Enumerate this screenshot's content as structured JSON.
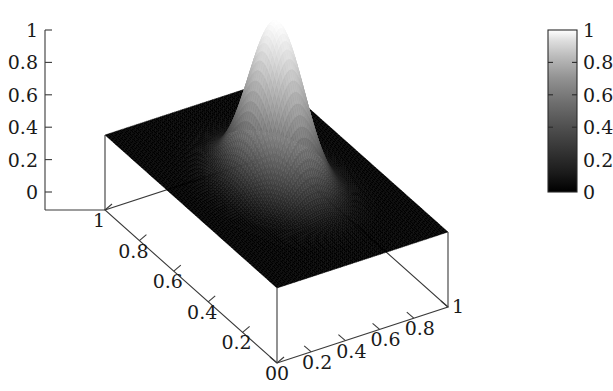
{
  "figure": {
    "type": "surface-plot-3d",
    "background_color": "#ffffff",
    "axis_color": "#3a3a3a",
    "text_color": "#1a1a1a"
  },
  "chart_data": {
    "type": "heatmap",
    "render_style": "3d-surface-mesh",
    "title": "",
    "xlabel": "",
    "ylabel": "",
    "zlabel": "",
    "grid": false,
    "xlim": [
      0,
      1
    ],
    "ylim": [
      0,
      1
    ],
    "zlim": [
      0,
      1
    ],
    "x_ticks": [
      0,
      0.2,
      0.4,
      0.6,
      0.8,
      1
    ],
    "x_tick_labels": [
      "0",
      "0.2",
      "0.4",
      "0.6",
      "0.8",
      "1"
    ],
    "y_ticks": [
      0,
      0.2,
      0.4,
      0.6,
      0.8,
      1
    ],
    "y_tick_labels": [
      "0",
      "0.2",
      "0.4",
      "0.6",
      "0.8",
      "1"
    ],
    "z_ticks": [
      0,
      0.2,
      0.4,
      0.6,
      0.8,
      1
    ],
    "z_tick_labels": [
      "0",
      "0.2",
      "0.4",
      "0.6",
      "0.8",
      "1"
    ],
    "colormap": "grayscale",
    "colormap_low": "#000000",
    "colormap_high": "#ffffff",
    "surface_function": "gaussian-peak",
    "peak": {
      "x": 0.5,
      "y": 0.5,
      "height": 1.0,
      "sigma": 0.115
    },
    "baseline_value": 0.0,
    "mesh_resolution": 86
  },
  "colorbar": {
    "orientation": "vertical",
    "min": 0,
    "max": 1,
    "ticks": [
      0,
      0.2,
      0.4,
      0.6,
      0.8,
      1
    ],
    "tick_labels": [
      "0",
      "0.2",
      "0.4",
      "0.6",
      "0.8",
      "1"
    ]
  },
  "z_axis": {
    "tick_labels": [
      "1",
      "0.8",
      "0.6",
      "0.4",
      "0.2",
      "0"
    ]
  },
  "x_axis_front_right": {
    "tick_labels": [
      "0",
      "0.2",
      "0.4",
      "0.6",
      "0.8",
      "1"
    ]
  },
  "y_axis_front_left": {
    "tick_labels": [
      "1",
      "0.8",
      "0.6",
      "0.4",
      "0.2",
      "0"
    ]
  }
}
